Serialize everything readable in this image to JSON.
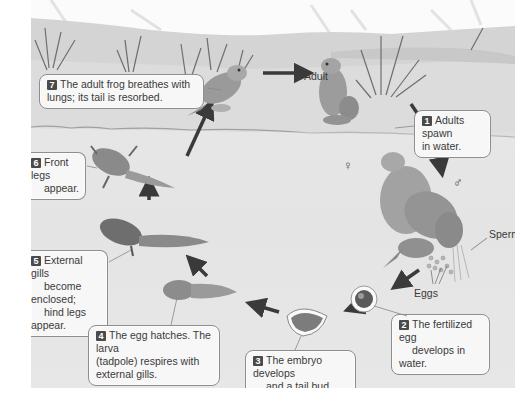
{
  "diagram": {
    "stages": [
      {
        "number": "1",
        "text_line1": "Adults spawn",
        "text_line2": "in water."
      },
      {
        "number": "2",
        "text_line1": "The fertilized egg",
        "text_line2": "develops in water."
      },
      {
        "number": "3",
        "text_line1": "The embryo develops",
        "text_line2": "and a tail bud forms."
      },
      {
        "number": "4",
        "text_line1": "The egg hatches. The larva",
        "text_line2": "(tadpole) respires with",
        "text_line3": "external gills."
      },
      {
        "number": "5",
        "text_line1": "External gills",
        "text_line2": "become enclosed;",
        "text_line3": "hind legs appear."
      },
      {
        "number": "6",
        "text_line1": "Front legs",
        "text_line2": "appear."
      },
      {
        "number": "7",
        "text_line1": "The adult frog breathes with",
        "text_line2": "lungs; its tail is resorbed."
      }
    ],
    "labels": {
      "adult": "Adult",
      "sperm": "Sperm",
      "eggs": "Eggs",
      "female_symbol": "♀",
      "male_symbol": "♂"
    }
  }
}
